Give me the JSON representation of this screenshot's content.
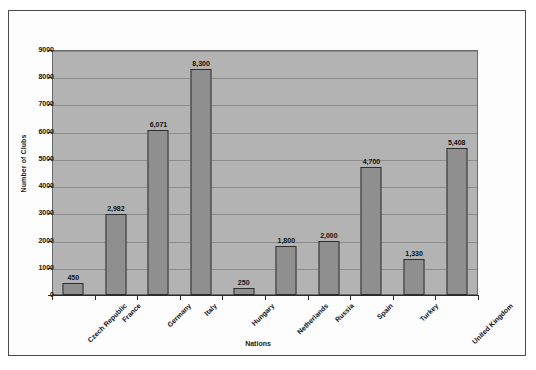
{
  "chart_data": {
    "type": "bar",
    "title": "",
    "xlabel": "Nations",
    "ylabel": "Number of Clubs",
    "categories": [
      "Czech Republic",
      "France",
      "Germany",
      "Italy",
      "Hungary",
      "Netherlands",
      "Russia",
      "Spain",
      "Turkey",
      "United Kingdom"
    ],
    "values": [
      450,
      2982,
      6071,
      8300,
      250,
      1800,
      2000,
      4700,
      1330,
      5408
    ],
    "value_labels": [
      "450",
      "2,982",
      "6,071",
      "8,300",
      "250",
      "1,800",
      "2,000",
      "4,700",
      "1,330",
      "5,408"
    ],
    "ylim": [
      0,
      9000
    ],
    "ytick_labels": [
      "9000",
      "8000",
      "7000",
      "6000",
      "5000",
      "4000",
      "3000",
      "2000",
      "1000",
      "0"
    ],
    "ytick_values": [
      9000,
      8000,
      7000,
      6000,
      5000,
      4000,
      3000,
      2000,
      1000,
      0
    ],
    "grid": true,
    "legend": false,
    "legend_position": "none",
    "colors": {
      "bar_fill": "#8f8f8f",
      "bar_border": "#2e2e2e",
      "plot_background": "#b3b3b3",
      "gridline": "#8c8c8c",
      "axis": "#2b2b2b",
      "text": "#111111",
      "page_border": "#4a4a4a"
    }
  }
}
